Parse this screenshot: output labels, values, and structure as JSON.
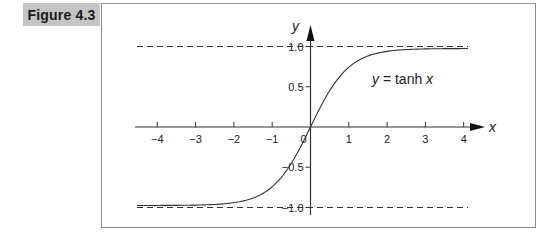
{
  "figure": {
    "label": "Figure 4.3"
  },
  "chart_data": {
    "type": "line",
    "title": "",
    "function": "y = tanh x",
    "annotation": {
      "text_var": "y",
      "text_eq": " = tanh ",
      "text_x": "x"
    },
    "xlabel": "x",
    "ylabel": "y",
    "xlim": [
      -4.3,
      4.3
    ],
    "ylim": [
      -1.1,
      1.15
    ],
    "x_ticks": [
      -4,
      -3,
      -2,
      -1,
      0,
      1,
      2,
      3,
      4
    ],
    "x_tick_labels": [
      "−4",
      "−3",
      "−2",
      "−1",
      "0",
      "1",
      "2",
      "3",
      "4"
    ],
    "y_ticks": [
      1.0,
      0.5,
      -0.5,
      -1.0
    ],
    "y_tick_labels": [
      "1.0",
      "0.5",
      "−0.5",
      "−1.0"
    ],
    "asymptotes": [
      1.0,
      -1.0
    ],
    "asymptote_style": "dashed",
    "grid": false,
    "legend": null,
    "series": [
      {
        "name": "tanh x",
        "x": [
          -4.3,
          -4,
          -3.5,
          -3,
          -2.5,
          -2,
          -1.5,
          -1,
          -0.5,
          0,
          0.5,
          1,
          1.5,
          2,
          2.5,
          3,
          3.5,
          4,
          4.3
        ],
        "y": [
          -0.9996,
          -0.9993,
          -0.9982,
          -0.9951,
          -0.9866,
          -0.964,
          -0.9051,
          -0.7616,
          -0.4621,
          0,
          0.4621,
          0.7616,
          0.9051,
          0.964,
          0.9866,
          0.9951,
          0.9982,
          0.9993,
          0.9996
        ]
      }
    ]
  }
}
